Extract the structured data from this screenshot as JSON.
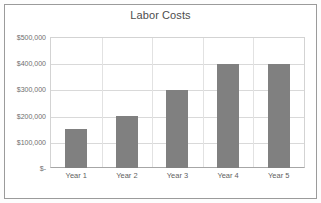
{
  "chart_data": {
    "type": "bar",
    "title": "Labor Costs",
    "categories": [
      "Year 1",
      "Year 2",
      "Year 3",
      "Year 4",
      "Year 5"
    ],
    "values": [
      150000,
      200000,
      300000,
      400000,
      400000
    ],
    "xlabel": "",
    "ylabel": "",
    "ylim": [
      0,
      500000
    ],
    "ytick_labels": [
      "$-",
      "$100,000",
      "$200,000",
      "$300,000",
      "$400,000",
      "$500,000"
    ],
    "ytick_values": [
      0,
      100000,
      200000,
      300000,
      400000,
      500000
    ],
    "grid": true,
    "legend": false,
    "series_color": "#808080",
    "gridline_color": "#d9d9d9",
    "plot_border_color": "#d3d3d3",
    "title_color": "#4d4d4d",
    "axis_text_color": "#6e6e6e",
    "frame_border_color": "#9b9b9b",
    "background_color": "#ffffff"
  }
}
